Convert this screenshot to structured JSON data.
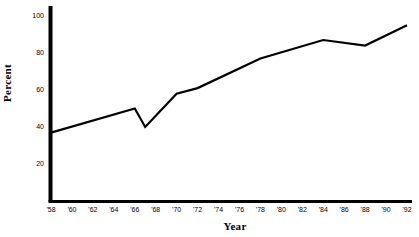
{
  "chart_data": {
    "type": "line",
    "title": "",
    "xlabel": "Year",
    "ylabel": "Percent",
    "grid": false,
    "legend": "none",
    "xlim": [
      1958,
      1992
    ],
    "ylim": [
      0,
      105
    ],
    "yticks": [
      20,
      40,
      60,
      80,
      100
    ],
    "ytick_labels": [
      "20",
      "40",
      "60",
      "80",
      "100"
    ],
    "xticks": [
      1958,
      1960,
      1962,
      1964,
      1966,
      1968,
      1970,
      1972,
      1974,
      1976,
      1978,
      1980,
      1982,
      1984,
      1986,
      1988,
      1990,
      1992
    ],
    "xtick_labels": [
      "'58",
      "'60",
      "'62",
      "'64",
      "'66",
      "'68",
      "'70",
      "'72",
      "'74",
      "'76",
      "'78",
      "'80",
      "'82",
      "'84",
      "'86",
      "'88",
      "'90",
      "'92"
    ],
    "series": [
      {
        "name": "Percent",
        "color": "#000000",
        "x": [
          1958,
          1966,
          1967,
          1970,
          1972,
          1978,
          1984,
          1988,
          1992
        ],
        "values": [
          37,
          50,
          40,
          58,
          61,
          77,
          87,
          84,
          95
        ]
      }
    ]
  }
}
